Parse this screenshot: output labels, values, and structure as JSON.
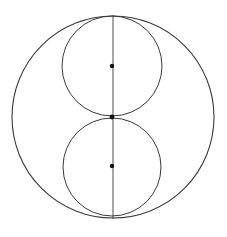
{
  "diagram": {
    "stroke_color": "#3a3a3a",
    "dot_color": "#111111",
    "background": "#ffffff",
    "outer_circle": {
      "cx": 113,
      "cy": 117,
      "r": 101
    },
    "inner_circles": [
      {
        "cx": 112,
        "cy": 66,
        "r": 50
      },
      {
        "cx": 112,
        "cy": 167,
        "r": 49
      }
    ],
    "vertical_line": {
      "x1": 113,
      "y1": 15,
      "x2": 113,
      "y2": 219
    },
    "points": [
      {
        "cx": 112,
        "cy": 66,
        "r": 2.2
      },
      {
        "cx": 112,
        "cy": 117,
        "r": 2.4
      },
      {
        "cx": 112,
        "cy": 166,
        "r": 2.2
      }
    ]
  }
}
